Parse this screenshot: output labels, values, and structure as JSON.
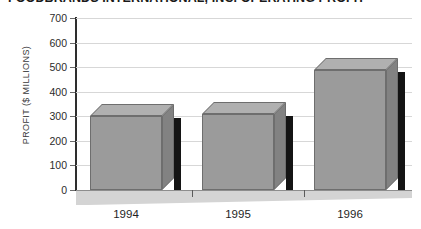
{
  "chart_data": {
    "type": "bar",
    "title": "FOODBRANDS INTERNATIONAL, INC. OPERATING PROFIT",
    "xlabel": "",
    "ylabel": "PROFIT ($ MILLIONS)",
    "categories": [
      "1994",
      "1995",
      "1996"
    ],
    "values": [
      300,
      310,
      490
    ],
    "ylim": [
      0,
      700
    ],
    "yticks": [
      "0",
      "100",
      "200",
      "300",
      "400",
      "500",
      "600",
      "700"
    ],
    "ytick_values": [
      0,
      100,
      200,
      300,
      400,
      500,
      600,
      700
    ],
    "grid": true,
    "legend": false,
    "style_3d": true,
    "colors": {
      "bar_front": "#9b9b9b",
      "bar_top": "#b0b0b0",
      "bar_side": "#828282",
      "bar_shadow": "#141414",
      "gridline": "#d7d7d7",
      "axis": "#2e2e2e",
      "floor": "#d4d4d4",
      "background": "#ffffff",
      "text": "#1f1f1f"
    }
  }
}
